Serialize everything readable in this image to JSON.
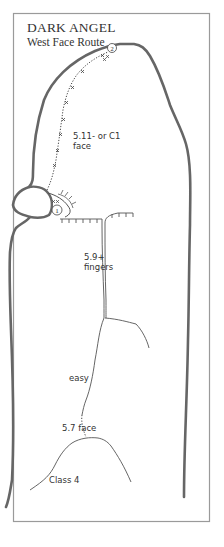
{
  "header": {
    "title": "DARK ANGEL",
    "subtitle": "West Face Route"
  },
  "colors": {
    "frame": "#9a9a9a",
    "rock_outline": "#666666",
    "route_line": "#444444",
    "text": "#333333"
  },
  "pitches": [
    {
      "number": "1",
      "belay": "xx"
    },
    {
      "number": "2",
      "belay": "xx"
    }
  ],
  "grades": [
    {
      "id": "p2",
      "line1": "5.11- or C1",
      "line2": "face"
    },
    {
      "id": "crack",
      "line1": "5.9+",
      "line2": "fingers"
    },
    {
      "id": "easy",
      "line1": "easy"
    },
    {
      "id": "face57",
      "line1": "5.7 face"
    },
    {
      "id": "class4",
      "line1": "Class 4"
    }
  ]
}
